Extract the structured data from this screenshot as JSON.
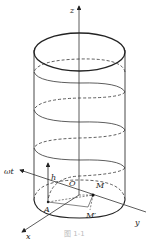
{
  "diagram": {
    "type": "cylinder-helix",
    "labels": {
      "z": "z",
      "x": "x",
      "y": "y",
      "omega_t": "ωt",
      "h": "h",
      "O": "O",
      "A": "A",
      "M_top": "M",
      "M_prime": "M′"
    },
    "caption": "图 1-1",
    "colors": {
      "stroke": "#333333",
      "background": "#ffffff"
    }
  }
}
